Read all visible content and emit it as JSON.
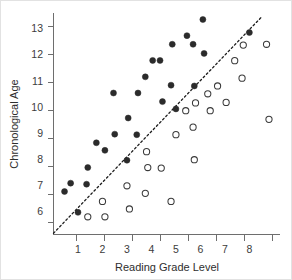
{
  "chart_data": {
    "type": "scatter",
    "title": "",
    "xlabel": "Reading Grade Level",
    "ylabel": "Chronological Age",
    "xlim": [
      0,
      9.25
    ],
    "ylim": [
      5.1,
      13.6
    ],
    "xticks": [
      1,
      2,
      3,
      4,
      5,
      6,
      7,
      8
    ],
    "yticks": [
      6,
      7,
      8,
      9,
      10,
      11,
      12,
      13
    ],
    "grid": false,
    "legend": "none",
    "annotations": [
      {
        "name": "reference-line",
        "type": "dotted-line",
        "description": "Dotted diagonal reference line rising from lower-left origin to upper-right",
        "from": [
          0.0,
          5.15
        ],
        "to": [
          8.5,
          13.45
        ]
      }
    ],
    "series": [
      {
        "name": "Filled circles",
        "marker": "filled-circle",
        "color": "#2b2b2b",
        "points": [
          [
            0.45,
            6.75
          ],
          [
            0.7,
            7.07
          ],
          [
            1.0,
            5.95
          ],
          [
            1.35,
            7.03
          ],
          [
            1.4,
            7.67
          ],
          [
            1.75,
            8.62
          ],
          [
            2.1,
            8.33
          ],
          [
            2.45,
            10.53
          ],
          [
            2.5,
            8.95
          ],
          [
            3.0,
            7.95
          ],
          [
            3.05,
            9.57
          ],
          [
            3.4,
            8.93
          ],
          [
            3.45,
            10.53
          ],
          [
            3.75,
            11.15
          ],
          [
            4.05,
            11.78
          ],
          [
            4.35,
            11.78
          ],
          [
            4.45,
            10.2
          ],
          [
            4.8,
            10.83
          ],
          [
            4.85,
            12.4
          ],
          [
            5.0,
            9.92
          ],
          [
            5.45,
            12.73
          ],
          [
            5.7,
            12.4
          ],
          [
            5.75,
            10.8
          ],
          [
            6.1,
            13.35
          ],
          [
            6.15,
            12.05
          ],
          [
            8.0,
            12.85
          ]
        ]
      },
      {
        "name": "Open circles",
        "marker": "open-circle",
        "color": "#3a3a3a",
        "points": [
          [
            1.4,
            5.78
          ],
          [
            2.0,
            6.37
          ],
          [
            2.1,
            5.78
          ],
          [
            3.0,
            6.97
          ],
          [
            3.1,
            6.08
          ],
          [
            3.75,
            6.68
          ],
          [
            3.8,
            8.28
          ],
          [
            3.85,
            7.67
          ],
          [
            4.4,
            7.65
          ],
          [
            4.8,
            6.37
          ],
          [
            5.0,
            8.93
          ],
          [
            5.4,
            9.85
          ],
          [
            5.7,
            9.22
          ],
          [
            5.75,
            7.97
          ],
          [
            5.8,
            10.15
          ],
          [
            6.3,
            10.5
          ],
          [
            6.4,
            9.85
          ],
          [
            6.7,
            10.8
          ],
          [
            7.05,
            10.17
          ],
          [
            7.4,
            11.77
          ],
          [
            7.7,
            11.1
          ],
          [
            7.75,
            12.37
          ],
          [
            8.7,
            12.4
          ],
          [
            8.8,
            9.52
          ]
        ]
      }
    ]
  },
  "axes": {
    "y_label": "Chronological Age",
    "x_label": "Reading Grade Level",
    "y_tick_labels": [
      "13",
      "12",
      "11",
      "10",
      "9",
      "8",
      "7",
      "6"
    ],
    "x_tick_labels": [
      "1",
      "2",
      "3",
      "4",
      "5",
      "6",
      "7",
      "8"
    ]
  }
}
